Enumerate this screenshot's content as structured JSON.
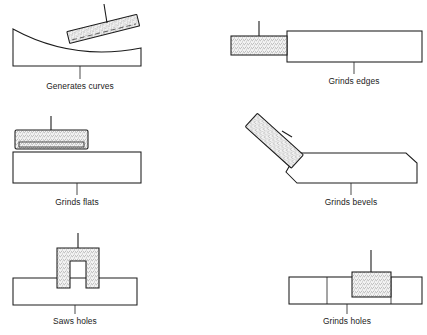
{
  "figure": {
    "background_color": "#ffffff",
    "line_color": "#1c1c1c",
    "abrasive_fill": "#f2f2f2",
    "panels": [
      {
        "id": "generates-curves",
        "caption": "Generates curves",
        "tool": "tilted abrasive stick",
        "workpiece": "block with concave curved top"
      },
      {
        "id": "grinds-edges",
        "caption": "Grinds edges",
        "tool": "horizontal abrasive wheel with stem",
        "workpiece": "plain rectangular bar"
      },
      {
        "id": "grinds-flats",
        "caption": "Grinds flats",
        "tool": "flat abrasive pad with stem",
        "workpiece": "plain rectangular bar"
      },
      {
        "id": "grinds-bevels",
        "caption": "Grinds bevels",
        "tool": "angled abrasive stick at 45 degrees",
        "workpiece": "bar with chamfered top corners"
      },
      {
        "id": "saws-holes",
        "caption": "Saws holes",
        "tool": "U-shaped saw with two abrasive legs",
        "workpiece": "bar with two slots"
      },
      {
        "id": "grinds-holes",
        "caption": "Grinds holes",
        "tool": "abrasive block with upper stem",
        "workpiece": "segmented bar with hole"
      }
    ]
  }
}
